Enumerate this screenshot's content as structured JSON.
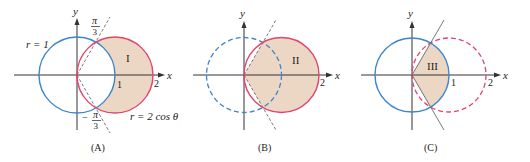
{
  "colors": {
    "shade": "#ecd7c4",
    "red": "#e0456c",
    "blue": "#3d85cc",
    "axis": "#333333",
    "ray": "#555555"
  },
  "panels": [
    {
      "id": "A",
      "caption": "(A)",
      "region_label": "I",
      "axis_x_label": "x",
      "axis_y_label": "y",
      "tick_1": "1",
      "tick_2": "2",
      "circle_label_blue": "r = 1",
      "circle_label_red": "r = 2 cos θ",
      "angle_top_num": "π",
      "angle_top_den": "3",
      "angle_bottom_sign": "−",
      "angle_bottom_num": "π",
      "angle_bottom_den": "3"
    },
    {
      "id": "B",
      "caption": "(B)",
      "region_label": "II",
      "axis_x_label": "x",
      "axis_y_label": "y",
      "tick_2": "2"
    },
    {
      "id": "C",
      "caption": "(C)",
      "region_label": "III",
      "axis_x_label": "x",
      "axis_y_label": "y",
      "tick_1": "1",
      "tick_2": "2"
    }
  ]
}
